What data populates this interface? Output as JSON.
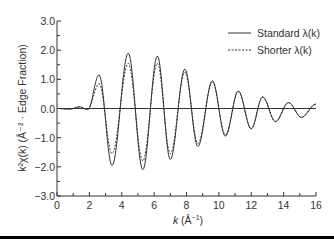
{
  "chart_data": {
    "type": "line",
    "title": "",
    "xlabel": "k (Å^-1)",
    "ylabel": "k^2 χ(k) (Å^-2 · Edge Fraction)",
    "xlim": [
      0,
      16
    ],
    "ylim": [
      -3.0,
      3.0
    ],
    "x_ticks": [
      0,
      2,
      4,
      6,
      8,
      10,
      12,
      14,
      16
    ],
    "y_ticks": [
      "3.0",
      "2.0",
      "1.0",
      "0.0",
      "−1.0",
      "−2.0",
      "−3.0"
    ],
    "grid": false,
    "legend_position": "upper right",
    "series": [
      {
        "name": "Standard λ(k)",
        "style": "solid",
        "points": [
          [
            0,
            0.0
          ],
          [
            0.8,
            -0.02
          ],
          [
            1.4,
            0.06
          ],
          [
            1.9,
            -0.04
          ],
          [
            2.6,
            1.15
          ],
          [
            3.4,
            -1.95
          ],
          [
            4.4,
            1.9
          ],
          [
            5.3,
            -2.1
          ],
          [
            6.2,
            1.8
          ],
          [
            7.0,
            -1.75
          ],
          [
            7.9,
            1.35
          ],
          [
            8.7,
            -1.3
          ],
          [
            9.6,
            0.95
          ],
          [
            10.4,
            -0.95
          ],
          [
            11.2,
            0.6
          ],
          [
            12.0,
            -0.7
          ],
          [
            12.7,
            0.4
          ],
          [
            13.5,
            -0.45
          ],
          [
            14.3,
            0.2
          ],
          [
            15.1,
            -0.3
          ],
          [
            16.0,
            0.15
          ]
        ]
      },
      {
        "name": "Shorter λ(k)",
        "style": "dashed",
        "points": [
          [
            0,
            0.0
          ],
          [
            0.8,
            -0.02
          ],
          [
            1.4,
            0.05
          ],
          [
            1.9,
            -0.03
          ],
          [
            2.6,
            0.85
          ],
          [
            3.4,
            -1.55
          ],
          [
            4.4,
            1.55
          ],
          [
            5.3,
            -1.8
          ],
          [
            6.2,
            1.55
          ],
          [
            7.0,
            -1.55
          ],
          [
            7.9,
            1.25
          ],
          [
            8.7,
            -1.2
          ],
          [
            9.6,
            0.9
          ],
          [
            10.4,
            -0.9
          ],
          [
            11.2,
            0.58
          ],
          [
            12.0,
            -0.68
          ],
          [
            12.7,
            0.39
          ],
          [
            13.5,
            -0.44
          ],
          [
            14.3,
            0.2
          ],
          [
            15.1,
            -0.3
          ],
          [
            16.0,
            0.15
          ]
        ]
      }
    ]
  },
  "axes": {
    "x_title_k": "k",
    "x_title_unit": " (Å",
    "x_title_exp": "−1",
    "x_title_close": ")",
    "y_title": "k²χ(k) (Å⁻² · Edge Fraction)"
  },
  "legend": {
    "items": [
      {
        "label": "Standard λ(k)",
        "style": "solid"
      },
      {
        "label": "Shorter λ(k)",
        "style": "dashed"
      }
    ]
  },
  "colors": {
    "line": "#333333",
    "axis": "#333333",
    "rule": "#000000"
  }
}
